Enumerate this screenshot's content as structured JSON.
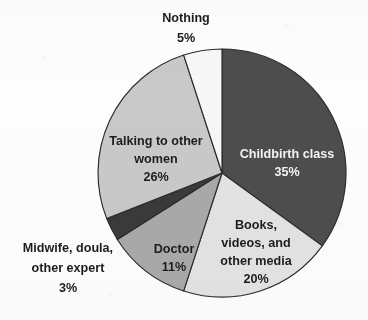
{
  "chart_data": {
    "type": "pie",
    "title": "",
    "subtitle": "",
    "xlabel": "",
    "ylabel": "",
    "legend_position": "none",
    "grid": false,
    "value_unit": "%",
    "start_angle_deg": 0,
    "direction": "clockwise",
    "total": 100,
    "categories": [
      "Childbirth class",
      "Books, videos, and other media",
      "Doctor",
      "Midwife, doula, other expert",
      "Talking to other women",
      "Nothing"
    ],
    "values": [
      35,
      20,
      11,
      3,
      26,
      5
    ],
    "slices": [
      {
        "name": "Childbirth class",
        "value": 35,
        "value_label": "35%",
        "label_lines": [
          "Childbirth class",
          "35%"
        ],
        "color": "#4d4d4d",
        "text_color": "#f4f4f4",
        "label_placement": "inside",
        "start_deg": 0,
        "end_deg": 126
      },
      {
        "name": "Books, videos, and other media",
        "value": 20,
        "value_label": "20%",
        "label_lines": [
          "Books,",
          "videos, and",
          "other media",
          "20%"
        ],
        "color": "#e3e3e3",
        "text_color": "#1d1d1d",
        "label_placement": "inside",
        "start_deg": 126,
        "end_deg": 198
      },
      {
        "name": "Doctor",
        "value": 11,
        "value_label": "11%",
        "label_lines": [
          "Doctor",
          "11%"
        ],
        "color": "#a9a9a9",
        "text_color": "#1d1d1d",
        "label_placement": "inside",
        "start_deg": 198,
        "end_deg": 237.6
      },
      {
        "name": "Midwife, doula, other expert",
        "value": 3,
        "value_label": "3%",
        "label_lines": [
          "Midwife, doula,",
          "other expert",
          "3%"
        ],
        "color": "#3a3a3a",
        "text_color": "#1d1d1d",
        "label_placement": "outside-left",
        "start_deg": 237.6,
        "end_deg": 248.4
      },
      {
        "name": "Talking to other women",
        "value": 26,
        "value_label": "26%",
        "label_lines": [
          "Talking to other",
          "women",
          "26%"
        ],
        "color": "#c9c9c9",
        "text_color": "#1d1d1d",
        "label_placement": "inside",
        "start_deg": 248.4,
        "end_deg": 342
      },
      {
        "name": "Nothing",
        "value": 5,
        "value_label": "5%",
        "label_lines": [
          "Nothing",
          "5%"
        ],
        "color": "#f7f7f7",
        "text_color": "#1d1d1d",
        "label_placement": "outside-top",
        "start_deg": 342,
        "end_deg": 360
      }
    ],
    "geometry": {
      "center_x": 222,
      "center_y": 173,
      "radius": 124,
      "stroke_color": "#2b2b2b",
      "stroke_width": 1.15
    },
    "background_color": "#fdfdfd"
  },
  "labels": {
    "childbirth_class": {
      "line1": "Childbirth class",
      "line2": "35%"
    },
    "books": {
      "line1": "Books,",
      "line2": "videos, and",
      "line3": "other media",
      "line4": "20%"
    },
    "doctor": {
      "line1": "Doctor",
      "line2": "11%"
    },
    "midwife": {
      "line1": "Midwife, doula,",
      "line2": "other expert",
      "line3": "3%"
    },
    "talking": {
      "line1": "Talking to other",
      "line2": "women",
      "line3": "26%"
    },
    "nothing": {
      "line1": "Nothing",
      "line2": "5%"
    }
  }
}
